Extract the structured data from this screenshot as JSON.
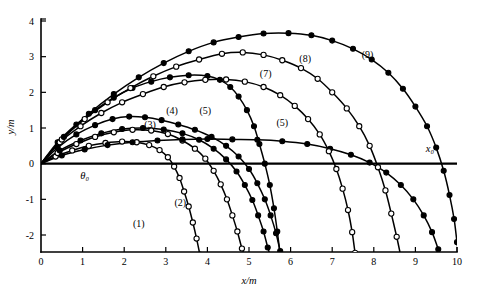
{
  "chart_data": {
    "type": "line",
    "title": "",
    "subtitle": "",
    "xlabel": "x/m",
    "ylabel": "y/m",
    "xlim": [
      0,
      10
    ],
    "ylim": [
      -2.6,
      4
    ],
    "xticks": [
      0,
      1,
      2,
      3,
      4,
      5,
      6,
      7,
      8,
      9,
      10
    ],
    "xtick_labels": [
      "0",
      "1",
      "2",
      "3",
      "4",
      "5",
      "6",
      "7",
      "8",
      "9",
      "10"
    ],
    "yticks": [
      -2,
      -1,
      0,
      1,
      2,
      3,
      4
    ],
    "ytick_labels": [
      "-2",
      "-1",
      "0",
      "1",
      "2",
      "3",
      "4"
    ],
    "grid": false,
    "legend": "none",
    "annotations": [
      {
        "text": "θ₀",
        "x": 1.05,
        "y": -0.42,
        "name": "theta-zero-annotation"
      },
      {
        "text": "x₀",
        "x": 9.35,
        "y": 0.33,
        "name": "x-zero-annotation"
      }
    ],
    "reference_lines": [
      {
        "name": "ground-level-line",
        "y": 0,
        "x_start": 0,
        "x_end": 10,
        "style": "solid-thick"
      }
    ],
    "series": [
      {
        "name": "(1)",
        "label_x": 2.35,
        "label_y": -1.78,
        "marker": "open-circle",
        "points": [
          [
            0.0,
            0.0
          ],
          [
            0.35,
            0.2
          ],
          [
            0.75,
            0.37
          ],
          [
            1.15,
            0.5
          ],
          [
            1.55,
            0.58
          ],
          [
            1.95,
            0.62
          ],
          [
            2.3,
            0.6
          ],
          [
            2.6,
            0.52
          ],
          [
            2.85,
            0.38
          ],
          [
            3.05,
            0.18
          ],
          [
            3.2,
            -0.08
          ],
          [
            3.33,
            -0.4
          ],
          [
            3.44,
            -0.78
          ],
          [
            3.55,
            -1.2
          ],
          [
            3.65,
            -1.65
          ],
          [
            3.74,
            -2.1
          ],
          [
            3.82,
            -2.55
          ]
        ]
      },
      {
        "name": "(2)",
        "label_x": 3.35,
        "label_y": -1.18,
        "marker": "open-circle",
        "points": [
          [
            0.0,
            0.0
          ],
          [
            0.4,
            0.3
          ],
          [
            0.85,
            0.55
          ],
          [
            1.3,
            0.75
          ],
          [
            1.75,
            0.88
          ],
          [
            2.2,
            0.95
          ],
          [
            2.65,
            0.93
          ],
          [
            3.05,
            0.83
          ],
          [
            3.4,
            0.65
          ],
          [
            3.7,
            0.42
          ],
          [
            3.95,
            0.14
          ],
          [
            4.15,
            -0.2
          ],
          [
            4.32,
            -0.58
          ],
          [
            4.47,
            -1.0
          ],
          [
            4.6,
            -1.45
          ],
          [
            4.72,
            -1.9
          ],
          [
            4.83,
            -2.38
          ],
          [
            4.9,
            -2.6
          ]
        ]
      },
      {
        "name": "(3)",
        "label_x": 2.62,
        "label_y": 1.0,
        "marker": "filled-circle",
        "points": [
          [
            0.0,
            0.0
          ],
          [
            0.45,
            0.37
          ],
          [
            0.95,
            0.65
          ],
          [
            1.45,
            0.85
          ],
          [
            1.95,
            0.97
          ],
          [
            2.45,
            1.0
          ],
          [
            2.95,
            0.96
          ],
          [
            3.4,
            0.85
          ],
          [
            3.8,
            0.67
          ],
          [
            4.15,
            0.42
          ],
          [
            4.45,
            0.12
          ],
          [
            4.7,
            -0.22
          ],
          [
            4.9,
            -0.6
          ],
          [
            5.08,
            -1.02
          ],
          [
            5.22,
            -1.45
          ],
          [
            5.35,
            -1.9
          ],
          [
            5.45,
            -2.35
          ],
          [
            5.52,
            -2.6
          ]
        ]
      },
      {
        "name": "(4)",
        "label_x": 3.15,
        "label_y": 1.4,
        "marker": "filled-circle",
        "points": [
          [
            0.0,
            0.0
          ],
          [
            0.4,
            0.45
          ],
          [
            0.85,
            0.82
          ],
          [
            1.3,
            1.08
          ],
          [
            1.72,
            1.25
          ],
          [
            2.12,
            1.32
          ],
          [
            2.5,
            1.3
          ],
          [
            2.9,
            1.22
          ],
          [
            3.3,
            1.1
          ],
          [
            3.7,
            0.95
          ],
          [
            4.1,
            0.75
          ],
          [
            4.45,
            0.5
          ],
          [
            4.75,
            0.2
          ],
          [
            5.0,
            -0.15
          ],
          [
            5.2,
            -0.55
          ],
          [
            5.38,
            -1.0
          ],
          [
            5.52,
            -1.45
          ],
          [
            5.65,
            -1.95
          ],
          [
            5.75,
            -2.45
          ],
          [
            5.8,
            -2.6
          ]
        ]
      },
      {
        "name": "(5)",
        "label_x": 3.95,
        "label_y": 1.4,
        "marker": "filled-circle",
        "points": [
          [
            0.0,
            0.0
          ],
          [
            0.4,
            0.6
          ],
          [
            0.85,
            1.1
          ],
          [
            1.3,
            1.5
          ],
          [
            1.75,
            1.85
          ],
          [
            2.2,
            2.12
          ],
          [
            2.65,
            2.3
          ],
          [
            3.1,
            2.42
          ],
          [
            3.55,
            2.48
          ],
          [
            4.0,
            2.46
          ],
          [
            4.3,
            2.35
          ],
          [
            4.55,
            2.15
          ],
          [
            4.75,
            1.88
          ],
          [
            4.95,
            1.5
          ],
          [
            5.12,
            1.05
          ],
          [
            5.25,
            0.55
          ],
          [
            5.38,
            0.0
          ],
          [
            5.5,
            -0.6
          ],
          [
            5.6,
            -1.25
          ],
          [
            5.68,
            -1.9
          ],
          [
            5.75,
            -2.55
          ]
        ]
      },
      {
        "name": "(5)",
        "label_x": 5.8,
        "label_y": 1.05,
        "marker": "filled-circle",
        "points": [
          [
            0.0,
            0.0
          ],
          [
            0.5,
            0.23
          ],
          [
            1.05,
            0.4
          ],
          [
            1.6,
            0.52
          ],
          [
            2.2,
            0.6
          ],
          [
            2.8,
            0.65
          ],
          [
            3.4,
            0.68
          ],
          [
            4.0,
            0.69
          ],
          [
            4.6,
            0.68
          ],
          [
            5.2,
            0.67
          ],
          [
            5.8,
            0.63
          ],
          [
            6.4,
            0.55
          ],
          [
            6.95,
            0.42
          ],
          [
            7.45,
            0.25
          ],
          [
            7.9,
            0.03
          ],
          [
            8.3,
            -0.25
          ],
          [
            8.65,
            -0.6
          ],
          [
            8.95,
            -1.0
          ],
          [
            9.2,
            -1.45
          ],
          [
            9.4,
            -1.92
          ],
          [
            9.55,
            -2.4
          ],
          [
            9.62,
            -2.6
          ]
        ]
      },
      {
        "name": "(7)",
        "label_x": 5.4,
        "label_y": 2.42,
        "marker": "open-circle",
        "points": [
          [
            0.0,
            0.0
          ],
          [
            0.45,
            0.6
          ],
          [
            0.95,
            1.05
          ],
          [
            1.45,
            1.42
          ],
          [
            1.95,
            1.72
          ],
          [
            2.45,
            1.95
          ],
          [
            2.95,
            2.15
          ],
          [
            3.45,
            2.28
          ],
          [
            3.95,
            2.35
          ],
          [
            4.45,
            2.36
          ],
          [
            4.9,
            2.3
          ],
          [
            5.35,
            2.15
          ],
          [
            5.75,
            1.92
          ],
          [
            6.1,
            1.62
          ],
          [
            6.42,
            1.25
          ],
          [
            6.7,
            0.82
          ],
          [
            6.92,
            0.35
          ],
          [
            7.1,
            -0.15
          ],
          [
            7.25,
            -0.7
          ],
          [
            7.38,
            -1.3
          ],
          [
            7.48,
            -1.92
          ],
          [
            7.55,
            -2.5
          ],
          [
            7.58,
            -2.6
          ]
        ]
      },
      {
        "name": "(8)",
        "label_x": 6.35,
        "label_y": 2.85,
        "marker": "open-circle",
        "points": [
          [
            0.0,
            0.0
          ],
          [
            0.5,
            0.68
          ],
          [
            1.05,
            1.25
          ],
          [
            1.6,
            1.72
          ],
          [
            2.15,
            2.12
          ],
          [
            2.7,
            2.45
          ],
          [
            3.25,
            2.72
          ],
          [
            3.8,
            2.92
          ],
          [
            4.35,
            3.08
          ],
          [
            4.85,
            3.12
          ],
          [
            5.35,
            3.05
          ],
          [
            5.8,
            2.9
          ],
          [
            6.25,
            2.68
          ],
          [
            6.65,
            2.38
          ],
          [
            7.0,
            2.0
          ],
          [
            7.35,
            1.55
          ],
          [
            7.65,
            1.05
          ],
          [
            7.9,
            0.5
          ],
          [
            8.1,
            -0.1
          ],
          [
            8.28,
            -0.75
          ],
          [
            8.42,
            -1.4
          ],
          [
            8.55,
            -2.05
          ],
          [
            8.65,
            -2.6
          ]
        ]
      },
      {
        "name": "(9)",
        "label_x": 7.85,
        "label_y": 2.95,
        "marker": "filled-circle",
        "points": [
          [
            0.0,
            0.0
          ],
          [
            0.55,
            0.75
          ],
          [
            1.15,
            1.4
          ],
          [
            1.75,
            1.95
          ],
          [
            2.35,
            2.42
          ],
          [
            2.95,
            2.82
          ],
          [
            3.55,
            3.15
          ],
          [
            4.15,
            3.4
          ],
          [
            4.75,
            3.55
          ],
          [
            5.35,
            3.65
          ],
          [
            5.95,
            3.66
          ],
          [
            6.5,
            3.6
          ],
          [
            7.0,
            3.45
          ],
          [
            7.5,
            3.22
          ],
          [
            7.95,
            2.92
          ],
          [
            8.35,
            2.55
          ],
          [
            8.7,
            2.1
          ],
          [
            9.0,
            1.6
          ],
          [
            9.28,
            1.05
          ],
          [
            9.5,
            0.45
          ],
          [
            9.68,
            -0.2
          ],
          [
            9.82,
            -0.88
          ],
          [
            9.93,
            -1.55
          ],
          [
            10.0,
            -2.2
          ],
          [
            10.05,
            -2.6
          ]
        ]
      }
    ]
  }
}
